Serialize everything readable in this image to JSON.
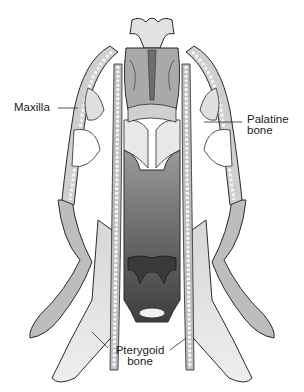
{
  "figure": {
    "colors": {
      "outline": "#2a2a2a",
      "bone_light": "#e6e6e6",
      "bone_mid": "#bdbdbd",
      "bone_dark": "#8e8e8e",
      "cavity_dark": "#4a4a4a",
      "teeth": "#f5f5f5",
      "background": "#ffffff"
    },
    "labels": [
      {
        "id": "maxilla",
        "text": "Maxilla"
      },
      {
        "id": "palatine",
        "line1": "Palatine",
        "line2": "bone"
      },
      {
        "id": "pterygoid",
        "line1": "Pterygoid",
        "line2": "bone"
      }
    ]
  }
}
